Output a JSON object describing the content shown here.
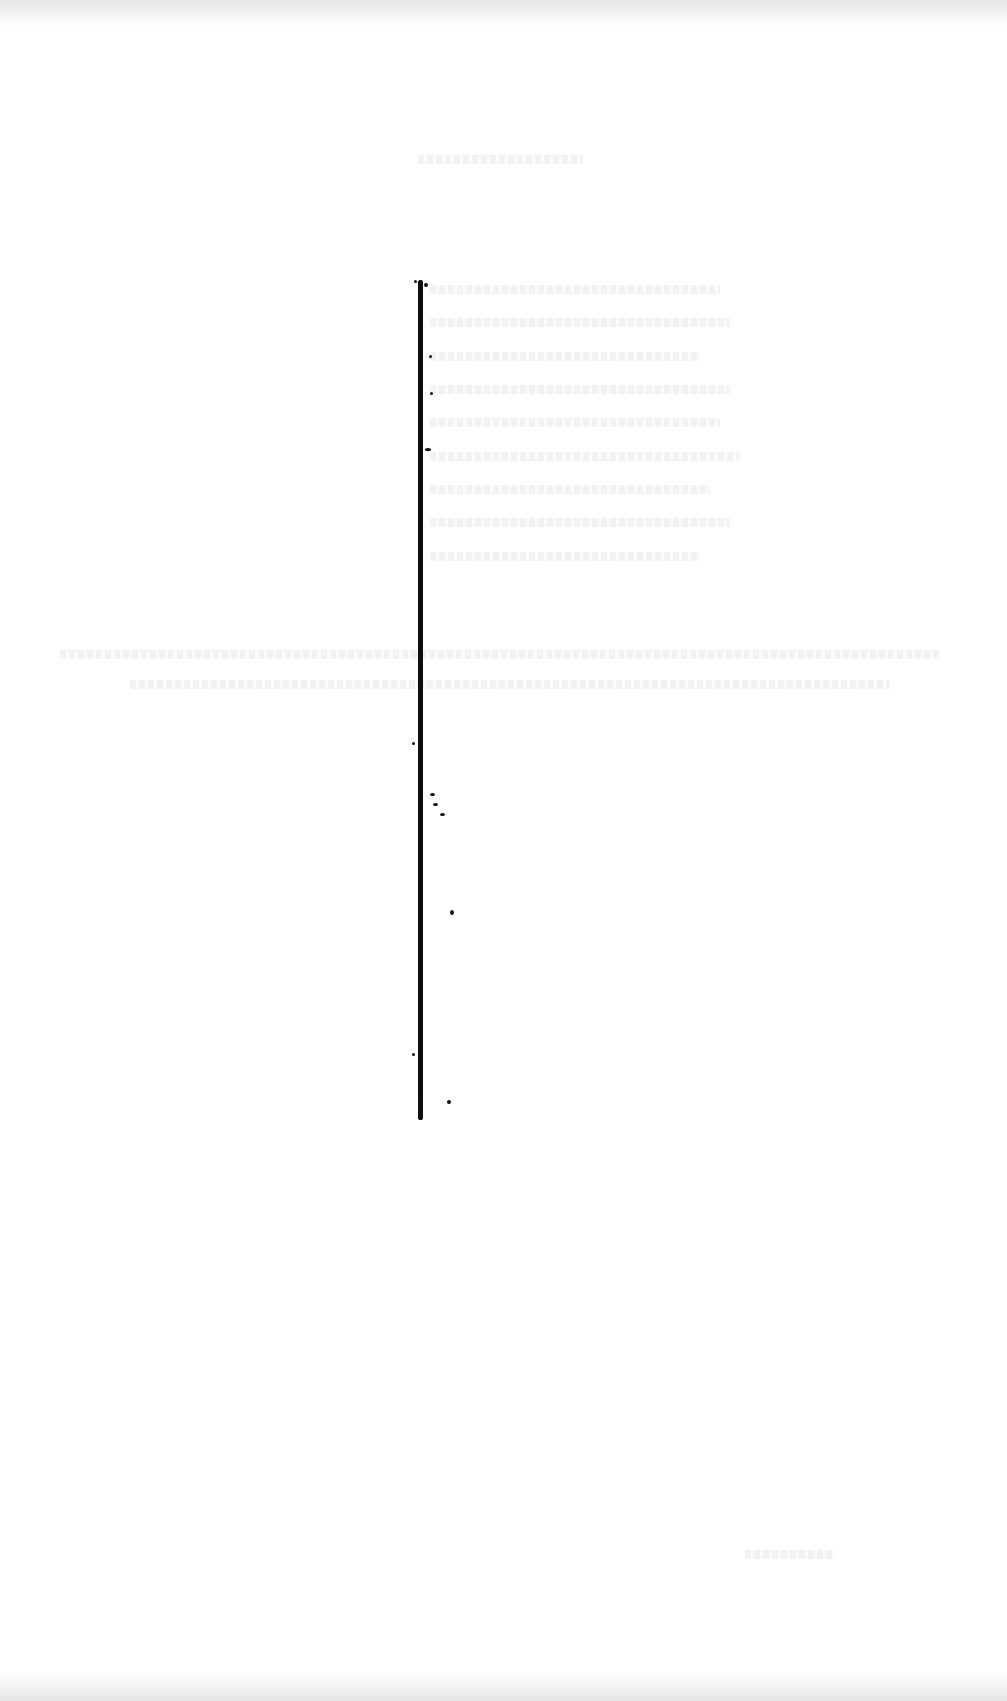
{
  "page": {
    "type": "scanned-page",
    "legible_text": [],
    "colors": {
      "paper": "#ffffff",
      "ink": "#0d0d0d",
      "bleed_through": "#f1f1f1"
    }
  }
}
